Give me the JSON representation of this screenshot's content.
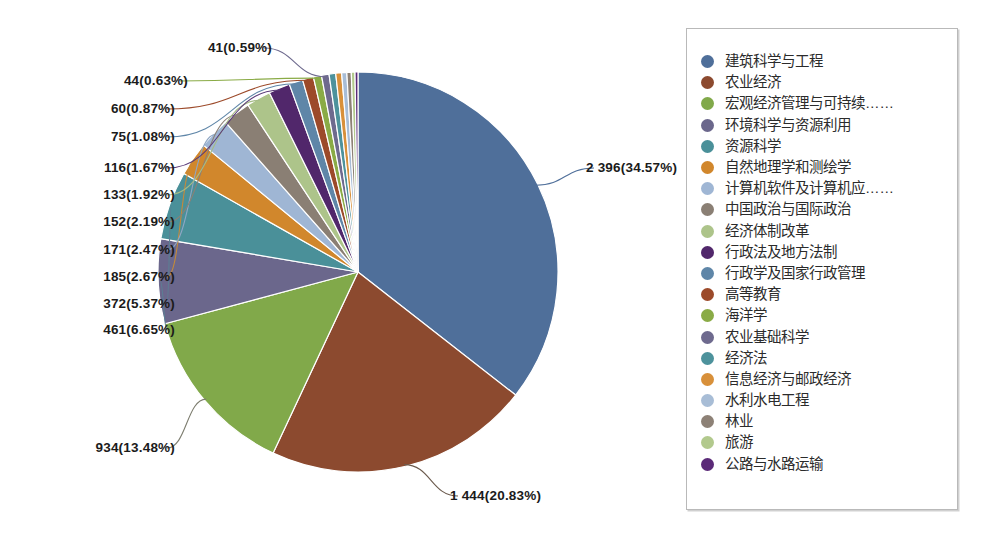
{
  "figure": {
    "background_color": "#ffffff",
    "pie": {
      "center_x": 358,
      "center_y": 272,
      "radius": 200,
      "start_angle_deg": 0,
      "direction": "clockwise",
      "slice_border_color": "#ffffff"
    }
  },
  "legend": {
    "name": "chart-legend",
    "border_color": "#b9b9b9",
    "background": "#ffffff",
    "items": [
      {
        "label": "建筑科学与工程",
        "color": "#4f6f9a"
      },
      {
        "label": "农业经济",
        "color": "#8c4a2f"
      },
      {
        "label": "宏观经济管理与可持续……",
        "color": "#81a94a"
      },
      {
        "label": "环境科学与资源利用",
        "color": "#6b678c"
      },
      {
        "label": "资源科学",
        "color": "#4a9099"
      },
      {
        "label": "自然地理学和测绘学",
        "color": "#d1872c"
      },
      {
        "label": "计算机软件及计算机应……",
        "color": "#9fb6d4"
      },
      {
        "label": "中国政治与国际政治",
        "color": "#8a7f74"
      },
      {
        "label": "经济体制改革",
        "color": "#adc48a"
      },
      {
        "label": "行政法及地方法制",
        "color": "#51276b"
      },
      {
        "label": "行政学及国家行政管理",
        "color": "#5f86a8"
      },
      {
        "label": "高等教育",
        "color": "#9c4a2a"
      },
      {
        "label": "海洋学",
        "color": "#8aab46"
      },
      {
        "label": "农业基础科学",
        "color": "#6e6a8e"
      },
      {
        "label": "经济法",
        "color": "#4d929c"
      },
      {
        "label": "信息经济与邮政经济",
        "color": "#d8903a"
      },
      {
        "label": "水利水电工程",
        "color": "#a8bdd6"
      },
      {
        "label": "林业",
        "color": "#8d8176"
      },
      {
        "label": "旅游",
        "color": "#b2c98d"
      },
      {
        "label": "公路与水路运输",
        "color": "#5b2a78"
      }
    ]
  },
  "chart_data": {
    "type": "pie",
    "title": "",
    "total": 6931,
    "value_format": "count(percent)",
    "categories": [
      "建筑科学与工程",
      "农业经济",
      "宏观经济管理与可持续……",
      "环境科学与资源利用",
      "资源科学",
      "自然地理学和测绘学",
      "计算机软件及计算机应……",
      "中国政治与国际政治",
      "经济体制改革",
      "行政法及地方法制",
      "行政学及国家行政管理",
      "高等教育",
      "海洋学",
      "农业基础科学",
      "经济法",
      "信息经济与邮政经济",
      "水利水电工程",
      "林业",
      "旅游",
      "公路与水路运输"
    ],
    "values": [
      2396,
      1444,
      934,
      461,
      372,
      185,
      171,
      152,
      133,
      116,
      75,
      60,
      44,
      41,
      36,
      32,
      28,
      24,
      20,
      16
    ],
    "percents": [
      34.57,
      20.83,
      13.48,
      6.65,
      5.37,
      2.67,
      2.47,
      2.19,
      1.92,
      1.67,
      1.08,
      0.87,
      0.63,
      0.59,
      0.52,
      0.46,
      0.4,
      0.35,
      0.29,
      0.23
    ],
    "colors": [
      "#4f6f9a",
      "#8c4a2f",
      "#81a94a",
      "#6b678c",
      "#4a9099",
      "#d1872c",
      "#9fb6d4",
      "#8a7f74",
      "#adc48a",
      "#51276b",
      "#5f86a8",
      "#9c4a2a",
      "#8aab46",
      "#6e6a8e",
      "#4d929c",
      "#d8903a",
      "#a8bdd6",
      "#8d8176",
      "#b2c98d",
      "#5b2a78"
    ],
    "labelled_slices": [
      {
        "index": 0,
        "text": "2 396(34.57%)",
        "x": 586,
        "y": 172,
        "anchor": "start",
        "leader_color": "#4f6f9a"
      },
      {
        "index": 1,
        "text": "1 444(20.83%)",
        "x": 450,
        "y": 500,
        "anchor": "start",
        "leader_color": "#6b5a4d"
      },
      {
        "index": 2,
        "text": "934(13.48%)",
        "x": 175,
        "y": 452,
        "anchor": "end",
        "leader_color": "#7d7d6f"
      },
      {
        "index": 3,
        "text": "461(6.65%)",
        "x": 175,
        "y": 334,
        "anchor": "end",
        "leader_color": "#5b7f93"
      },
      {
        "index": 4,
        "text": "372(5.37%)",
        "x": 175,
        "y": 308,
        "anchor": "end",
        "leader_color": "#5b7f93"
      },
      {
        "index": 5,
        "text": "185(2.67%)",
        "x": 175,
        "y": 281,
        "anchor": "end",
        "leader_color": "#c48a3a"
      },
      {
        "index": 6,
        "text": "171(2.47%)",
        "x": 175,
        "y": 254,
        "anchor": "end",
        "leader_color": "#8fa7c4"
      },
      {
        "index": 7,
        "text": "152(2.19%)",
        "x": 175,
        "y": 226,
        "anchor": "end",
        "leader_color": "#8b8075"
      },
      {
        "index": 8,
        "text": "133(1.92%)",
        "x": 175,
        "y": 199,
        "anchor": "end",
        "leader_color": "#a5bb86"
      },
      {
        "index": 9,
        "text": "116(1.67%)",
        "x": 175,
        "y": 172,
        "anchor": "end",
        "leader_color": "#5a3a78"
      },
      {
        "index": 10,
        "text": "75(1.08%)",
        "x": 175,
        "y": 141,
        "anchor": "end",
        "leader_color": "#5f86a8"
      },
      {
        "index": 11,
        "text": "60(0.87%)",
        "x": 175,
        "y": 113,
        "anchor": "end",
        "leader_color": "#9c4a2a"
      },
      {
        "index": 12,
        "text": "44(0.63%)",
        "x": 188,
        "y": 85,
        "anchor": "end",
        "leader_color": "#8aab46"
      },
      {
        "index": 13,
        "text": "41(0.59%)",
        "x": 272,
        "y": 52,
        "anchor": "end",
        "leader_color": "#6e6a8e"
      }
    ],
    "legend_position": "right",
    "grid": false,
    "xlabel": "",
    "ylabel": ""
  }
}
